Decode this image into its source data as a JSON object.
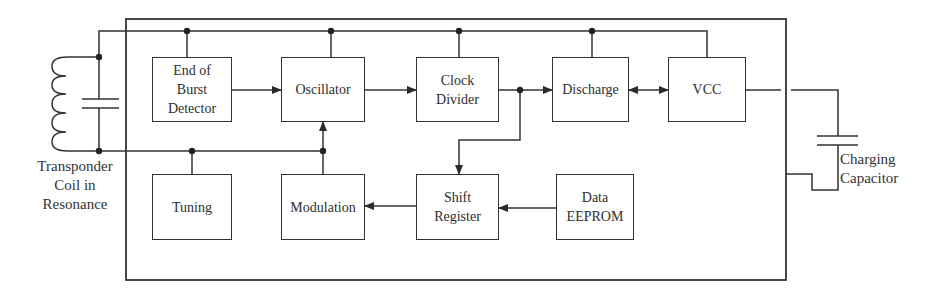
{
  "diagram": {
    "type": "block-diagram",
    "blocks": [
      {
        "id": "end_of_burst",
        "label": "End of\nBurst\nDetector"
      },
      {
        "id": "oscillator",
        "label": "Oscillator"
      },
      {
        "id": "clock_divider",
        "label": "Clock\nDivider"
      },
      {
        "id": "discharge",
        "label": "Discharge"
      },
      {
        "id": "vcc",
        "label": "VCC"
      },
      {
        "id": "tuning",
        "label": "Tuning"
      },
      {
        "id": "modulation",
        "label": "Modulation"
      },
      {
        "id": "shift_register",
        "label": "Shift\nRegister"
      },
      {
        "id": "data_eeprom",
        "label": "Data\nEEPROM"
      }
    ],
    "external_labels": {
      "coil": "Transponder\nCoil in\nResonance",
      "capacitor": "Charging\nCapacitor"
    },
    "connections": [
      {
        "from": "End of Burst Detector",
        "to": "Oscillator",
        "type": "arrow"
      },
      {
        "from": "Oscillator",
        "to": "Clock Divider",
        "type": "arrow"
      },
      {
        "from": "Clock Divider",
        "to": "Discharge",
        "type": "arrow"
      },
      {
        "from": "Clock Divider",
        "to": "Shift Register",
        "type": "arrow"
      },
      {
        "from": "Discharge",
        "to": "VCC",
        "type": "bidirectional"
      },
      {
        "from": "Data EEPROM",
        "to": "Shift Register",
        "type": "arrow"
      },
      {
        "from": "Shift Register",
        "to": "Modulation",
        "type": "arrow"
      },
      {
        "from": "Modulation",
        "to": "Oscillator",
        "type": "arrow"
      },
      {
        "from": "Transponder Coil",
        "to": "Tuning",
        "type": "line"
      },
      {
        "from": "VCC",
        "to": "Charging Capacitor",
        "type": "line"
      }
    ],
    "colors": {
      "line": "#333333",
      "background": "#ffffff"
    }
  }
}
